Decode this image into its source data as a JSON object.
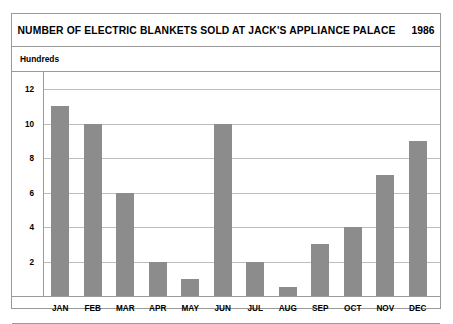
{
  "chart_data": {
    "type": "bar",
    "title": "NUMBER OF ELECTRIC BLANKETS SOLD AT JACK'S APPLIANCE PALACE",
    "year": "1986",
    "ylabel": "Hundreds",
    "xlabel": "",
    "categories": [
      "JAN",
      "FEB",
      "MAR",
      "APR",
      "MAY",
      "JUN",
      "JUL",
      "AUG",
      "SEP",
      "OCT",
      "NOV",
      "DEC"
    ],
    "values": [
      11,
      10,
      6,
      2,
      1,
      10,
      2,
      0.5,
      3,
      4,
      7,
      9
    ],
    "yticks": [
      2,
      4,
      6,
      8,
      10,
      12
    ],
    "ylim": [
      0,
      13
    ],
    "grid": true,
    "legend": false,
    "bar_color": "#8c8c8c",
    "frame_color": "#9a9a9a",
    "gridline_color": "#bcbcbc"
  }
}
